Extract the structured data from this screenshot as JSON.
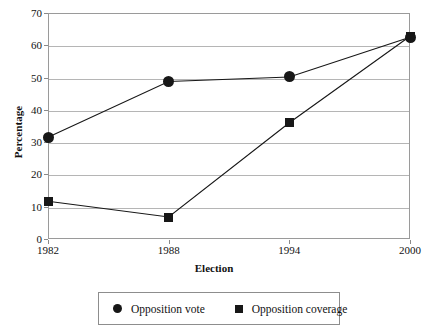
{
  "chart_data": {
    "type": "line",
    "title": "",
    "xlabel": "Election",
    "ylabel": "Percentage",
    "categories": [
      "1982",
      "1988",
      "1994",
      "2000"
    ],
    "ylim": [
      0,
      70
    ],
    "yticks": [
      "0",
      "10",
      "20",
      "30",
      "40",
      "50",
      "60",
      "70"
    ],
    "grid": "horizontal",
    "legend_position": "bottom",
    "series": [
      {
        "name": "Opposition vote",
        "marker": "circle",
        "color": "#171717",
        "values": [
          31.5,
          48.8,
          50.2,
          62.5
        ]
      },
      {
        "name": "Opposition coverage",
        "marker": "square",
        "color": "#171717",
        "values": [
          11.7,
          6.8,
          36.0,
          62.8
        ]
      }
    ]
  },
  "axes": {
    "y_title": "Percentage",
    "x_title": "Election"
  },
  "colors": {
    "series": "#171717",
    "gridline": "#b5b5b5",
    "frame": "#9a9a9a",
    "background": "#ffffff"
  }
}
